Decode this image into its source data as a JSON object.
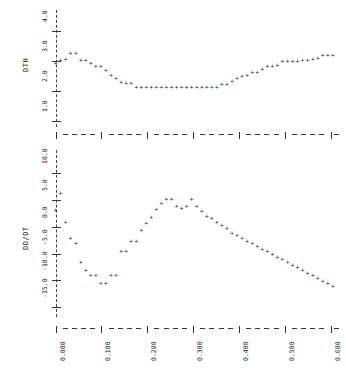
{
  "figure": {
    "background": "#ffffff",
    "marker_glyph": "+",
    "marker_color": "#111111",
    "guide_color": "#444444"
  },
  "chart_data": [
    {
      "type": "scatter",
      "panel": "top",
      "title": "",
      "xlabel": "",
      "ylabel": "DTH",
      "xlim": [
        -0.012,
        0.625
      ],
      "ylim": [
        0.85,
        4.35
      ],
      "yticks": [
        "1.0",
        "2.0",
        "3.0",
        "4.0"
      ],
      "ytickvals": [
        1.0,
        2.0,
        3.0,
        4.0
      ],
      "xticks": [
        "0.000",
        "0.100",
        "0.200",
        "0.300",
        "0.400",
        "0.500",
        "0.600"
      ],
      "xtickvals": [
        0.0,
        0.1,
        0.2,
        0.3,
        0.4,
        0.5,
        0.6
      ],
      "grid": "dashed-horizontal",
      "legend": "none",
      "vline_x": 0.0,
      "x": [
        0.0,
        0.011,
        0.022,
        0.033,
        0.044,
        0.055,
        0.066,
        0.077,
        0.088,
        0.099,
        0.11,
        0.121,
        0.132,
        0.143,
        0.154,
        0.165,
        0.176,
        0.187,
        0.198,
        0.209,
        0.22,
        0.231,
        0.242,
        0.253,
        0.264,
        0.275,
        0.286,
        0.297,
        0.308,
        0.319,
        0.33,
        0.341,
        0.352,
        0.363,
        0.374,
        0.385,
        0.396,
        0.407,
        0.418,
        0.429,
        0.44,
        0.451,
        0.462,
        0.473,
        0.484,
        0.495,
        0.506,
        0.517,
        0.528,
        0.539,
        0.55,
        0.561,
        0.572,
        0.583,
        0.594,
        0.605
      ],
      "y": [
        2.95,
        3.05,
        3.08,
        3.28,
        3.28,
        3.05,
        3.05,
        2.95,
        2.85,
        2.85,
        2.7,
        2.55,
        2.45,
        2.3,
        2.28,
        2.28,
        2.13,
        2.13,
        2.13,
        2.13,
        2.13,
        2.13,
        2.13,
        2.13,
        2.13,
        2.13,
        2.13,
        2.13,
        2.13,
        2.13,
        2.13,
        2.13,
        2.13,
        2.25,
        2.25,
        2.35,
        2.45,
        2.5,
        2.55,
        2.65,
        2.65,
        2.72,
        2.85,
        2.85,
        2.88,
        3.0,
        3.0,
        3.0,
        3.0,
        3.05,
        3.05,
        3.08,
        3.1,
        3.2,
        3.2,
        3.2
      ]
    },
    {
      "type": "scatter",
      "panel": "bottom",
      "title": "",
      "xlabel": "",
      "ylabel": "DD/DT",
      "xlim": [
        -0.012,
        0.625
      ],
      "ylim": [
        -16.5,
        12.5
      ],
      "yticks": [
        "-15.0",
        "-10.0",
        "-5.0",
        "0.0",
        "5.0",
        "10.0"
      ],
      "ytickvals": [
        -15.0,
        -10.0,
        -5.0,
        0.0,
        5.0,
        10.0
      ],
      "xticks": [
        "0.000",
        "0.100",
        "0.200",
        "0.300",
        "0.400",
        "0.500",
        "0.600"
      ],
      "xtickvals": [
        0.0,
        0.1,
        0.2,
        0.3,
        0.4,
        0.5,
        0.6
      ],
      "grid": "dashed-horizontal",
      "legend": "none",
      "vline_x": 0.0,
      "x": [
        0.0,
        0.011,
        0.022,
        0.033,
        0.044,
        0.055,
        0.066,
        0.077,
        0.088,
        0.099,
        0.11,
        0.121,
        0.132,
        0.143,
        0.154,
        0.165,
        0.176,
        0.187,
        0.198,
        0.209,
        0.22,
        0.231,
        0.242,
        0.253,
        0.264,
        0.275,
        0.286,
        0.297,
        0.308,
        0.319,
        0.33,
        0.341,
        0.352,
        0.363,
        0.374,
        0.385,
        0.396,
        0.407,
        0.418,
        0.429,
        0.44,
        0.451,
        0.462,
        0.473,
        0.484,
        0.495,
        0.506,
        0.517,
        0.528,
        0.539,
        0.55,
        0.561,
        0.572,
        0.583,
        0.594,
        0.605
      ],
      "y": [
        3.2,
        6.5,
        1.0,
        -2.0,
        -3.0,
        -6.5,
        -8.0,
        -9.0,
        -9.0,
        -10.5,
        -10.5,
        -9.0,
        -9.0,
        -4.5,
        -4.5,
        -2.5,
        -2.5,
        -0.5,
        0.8,
        2.0,
        3.5,
        4.5,
        5.3,
        5.3,
        4.0,
        3.7,
        4.0,
        5.3,
        4.0,
        3.0,
        2.2,
        1.8,
        1.0,
        0.5,
        -0.2,
        -1.0,
        -1.5,
        -2.0,
        -2.5,
        -3.0,
        -3.5,
        -4.0,
        -4.5,
        -5.0,
        -5.5,
        -6.0,
        -6.5,
        -7.0,
        -7.5,
        -8.0,
        -8.5,
        -9.0,
        -9.5,
        -10.0,
        -10.5,
        -11.0
      ]
    }
  ]
}
